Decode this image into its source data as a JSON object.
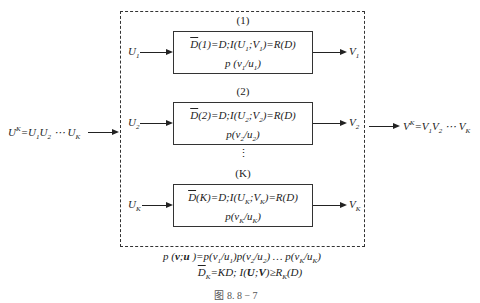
{
  "input": {
    "label": "U^K=U1U2 ⋯ UK"
  },
  "output": {
    "label": "V^K=V1V2 ⋯ VK"
  },
  "components": [
    {
      "index": "(1)",
      "in": "U1",
      "out": "V1",
      "line1": "D̄(1)=D;I(U1;V1)=R(D)",
      "line2": "p (v1/u1)"
    },
    {
      "index": "(2)",
      "in": "U2",
      "out": "V2",
      "line1": "D̄(2)=D;I(U2;V2)=R(D)",
      "line2": "p(v2/u2)"
    },
    {
      "index": "(K)",
      "in": "UK",
      "out": "VK",
      "line1": "D̄(K)=D;I(UK;VK)=R(D)",
      "line2": "p(vK/uK)"
    }
  ],
  "ellipsis": "⋮",
  "footer": {
    "line1": "p (v;u )=p(v1/u1)p(v2/u2) … p(vK/uK)",
    "line2": "D̄K=KD; I(U;V)≥RK(D)"
  },
  "caption": "图 8. 8 − 7"
}
